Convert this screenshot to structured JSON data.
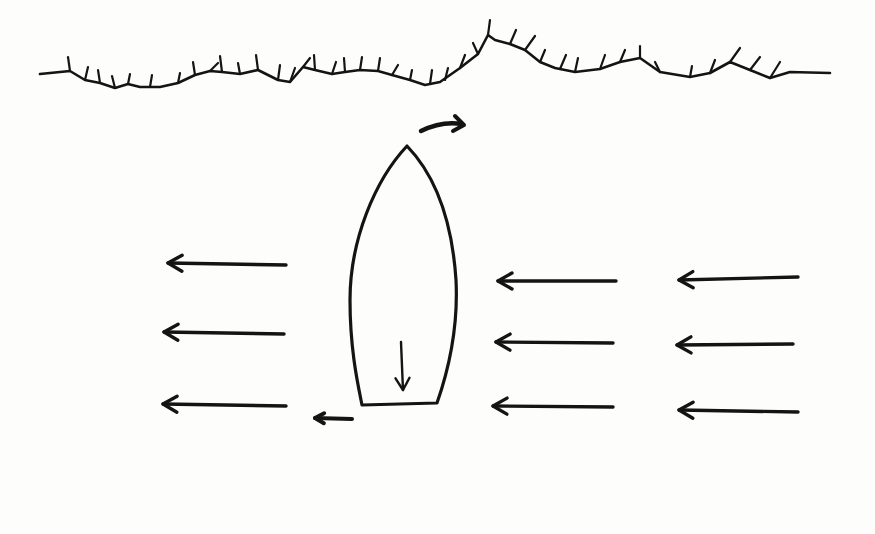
{
  "diagram": {
    "colors": {
      "background": "#fdfdfb",
      "ink": "#141414"
    },
    "shoreline": {
      "icon": "shoreline-vegetation",
      "path": "M40 74 L70 71 L85 80 L100 83 L115 88 L128 84 L140 87 L160 87 L178 83 L195 75 L210 71 L222 72 L240 74 L258 70 L278 80 L290 82 L303 67 L315 70 L332 74 L345 72 L360 70 L378 71 L392 75 L410 80 L425 85 L440 82 L460 68 L478 54 L488 35 L495 40 L510 44 L525 50 L540 62 L555 68 L575 72 L600 69 L620 62 L640 58 L660 72 L690 77 L710 73 L730 62 L750 70 L770 78 L790 72 L830 73",
      "spikes": [
        [
          70,
          71,
          68,
          57
        ],
        [
          85,
          80,
          88,
          67
        ],
        [
          100,
          83,
          98,
          70
        ],
        [
          115,
          88,
          112,
          76
        ],
        [
          128,
          84,
          130,
          74
        ],
        [
          150,
          87,
          152,
          75
        ],
        [
          178,
          83,
          180,
          73
        ],
        [
          195,
          75,
          193,
          62
        ],
        [
          210,
          71,
          218,
          63
        ],
        [
          222,
          72,
          220,
          56
        ],
        [
          240,
          74,
          238,
          63
        ],
        [
          258,
          70,
          256,
          55
        ],
        [
          278,
          80,
          280,
          65
        ],
        [
          290,
          82,
          295,
          68
        ],
        [
          303,
          67,
          310,
          58
        ],
        [
          315,
          70,
          314,
          55
        ],
        [
          332,
          74,
          336,
          62
        ],
        [
          345,
          72,
          344,
          58
        ],
        [
          360,
          70,
          362,
          57
        ],
        [
          378,
          71,
          380,
          58
        ],
        [
          392,
          75,
          398,
          65
        ],
        [
          410,
          80,
          412,
          70
        ],
        [
          430,
          84,
          432,
          70
        ],
        [
          445,
          80,
          448,
          68
        ],
        [
          460,
          68,
          465,
          55
        ],
        [
          478,
          54,
          473,
          43
        ],
        [
          488,
          35,
          490,
          20
        ],
        [
          510,
          44,
          516,
          30
        ],
        [
          525,
          50,
          535,
          36
        ],
        [
          540,
          62,
          545,
          50
        ],
        [
          560,
          69,
          566,
          55
        ],
        [
          575,
          72,
          578,
          58
        ],
        [
          600,
          69,
          605,
          55
        ],
        [
          620,
          62,
          625,
          50
        ],
        [
          640,
          58,
          640,
          46
        ],
        [
          660,
          72,
          655,
          62
        ],
        [
          690,
          77,
          692,
          66
        ],
        [
          710,
          73,
          715,
          60
        ],
        [
          730,
          62,
          740,
          48
        ],
        [
          750,
          70,
          760,
          57
        ],
        [
          770,
          78,
          780,
          62
        ]
      ]
    },
    "boat": {
      "icon": "boat-hull-outline",
      "path": "M407 146 C 375 180, 350 240, 350 300 C 350 350, 358 385, 362 405 L 437 403 C 452 360, 458 320, 456 280 C 452 220, 435 175, 407 146 Z",
      "inner_arrow": {
        "x1": 401,
        "y1": 342,
        "x2": 403,
        "y2": 390,
        "direction": "down"
      }
    },
    "bow_arrow": {
      "path": "M421 131 C 435 124, 450 122, 462 124",
      "head": [
        [
          455,
          116
        ],
        [
          464,
          125
        ],
        [
          453,
          131
        ]
      ],
      "direction": "right-curved"
    },
    "stern_arrow": {
      "x1": 352,
      "y1": 419,
      "x2": 315,
      "y2": 418,
      "direction": "left"
    },
    "current_arrows": [
      {
        "x1": 286,
        "y1": 265,
        "x2": 168,
        "y2": 263,
        "direction": "left"
      },
      {
        "x1": 284,
        "y1": 334,
        "x2": 164,
        "y2": 332,
        "direction": "left"
      },
      {
        "x1": 286,
        "y1": 406,
        "x2": 163,
        "y2": 404,
        "direction": "left"
      },
      {
        "x1": 616,
        "y1": 281,
        "x2": 498,
        "y2": 281,
        "direction": "left"
      },
      {
        "x1": 613,
        "y1": 343,
        "x2": 496,
        "y2": 342,
        "direction": "left"
      },
      {
        "x1": 613,
        "y1": 407,
        "x2": 493,
        "y2": 406,
        "direction": "left"
      },
      {
        "x1": 798,
        "y1": 277,
        "x2": 679,
        "y2": 280,
        "direction": "left"
      },
      {
        "x1": 793,
        "y1": 344,
        "x2": 677,
        "y2": 345,
        "direction": "left"
      },
      {
        "x1": 798,
        "y1": 412,
        "x2": 679,
        "y2": 410,
        "direction": "left"
      }
    ]
  }
}
